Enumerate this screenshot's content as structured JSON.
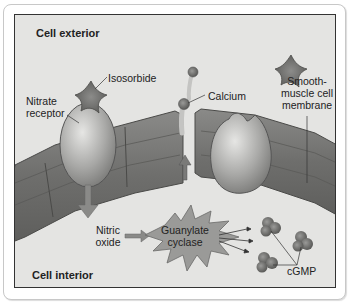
{
  "figure": {
    "regions": {
      "exterior": "Cell exterior",
      "interior": "Cell interior"
    },
    "labels": {
      "isosorbide": "Isosorbide",
      "nitrate_receptor_line1": "Nitrate",
      "nitrate_receptor_line2": "receptor",
      "calcium": "Calcium",
      "membrane_line1": "Smooth-",
      "membrane_line2": "muscle cell",
      "membrane_line3": "membrane",
      "nitric_oxide_line1": "Nitric",
      "nitric_oxide_line2": "oxide",
      "guanylate_line1": "Guanylate",
      "guanylate_line2": "cyclase",
      "cgmp": "cGMP"
    },
    "colors": {
      "background": "#e4e4e2",
      "membrane": "#7a7a78",
      "receptor": "#b4b4b2",
      "isosorbide": "#6e6e6c",
      "enzyme": "#9a9a98",
      "frame_border": "#333333"
    }
  }
}
